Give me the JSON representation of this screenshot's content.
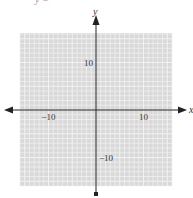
{
  "header": {
    "cut_text": "y   ="
  },
  "chart_data": {
    "type": "scatter",
    "title": "",
    "xlabel": "x",
    "ylabel": "y",
    "xlim": [
      -16,
      16
    ],
    "ylim": [
      -16,
      16
    ],
    "grid": true,
    "grid_step": 1,
    "x_ticks": [
      {
        "value": -10,
        "label": "−10"
      },
      {
        "value": 10,
        "label": "10"
      }
    ],
    "y_ticks": [
      {
        "value": 10,
        "label": "10"
      },
      {
        "value": -10,
        "label": "−10"
      }
    ],
    "series": [],
    "colors": {
      "grid_background": "#d9d9d9",
      "grid_lines": "#f2f2f2",
      "axis": "#222222"
    }
  }
}
